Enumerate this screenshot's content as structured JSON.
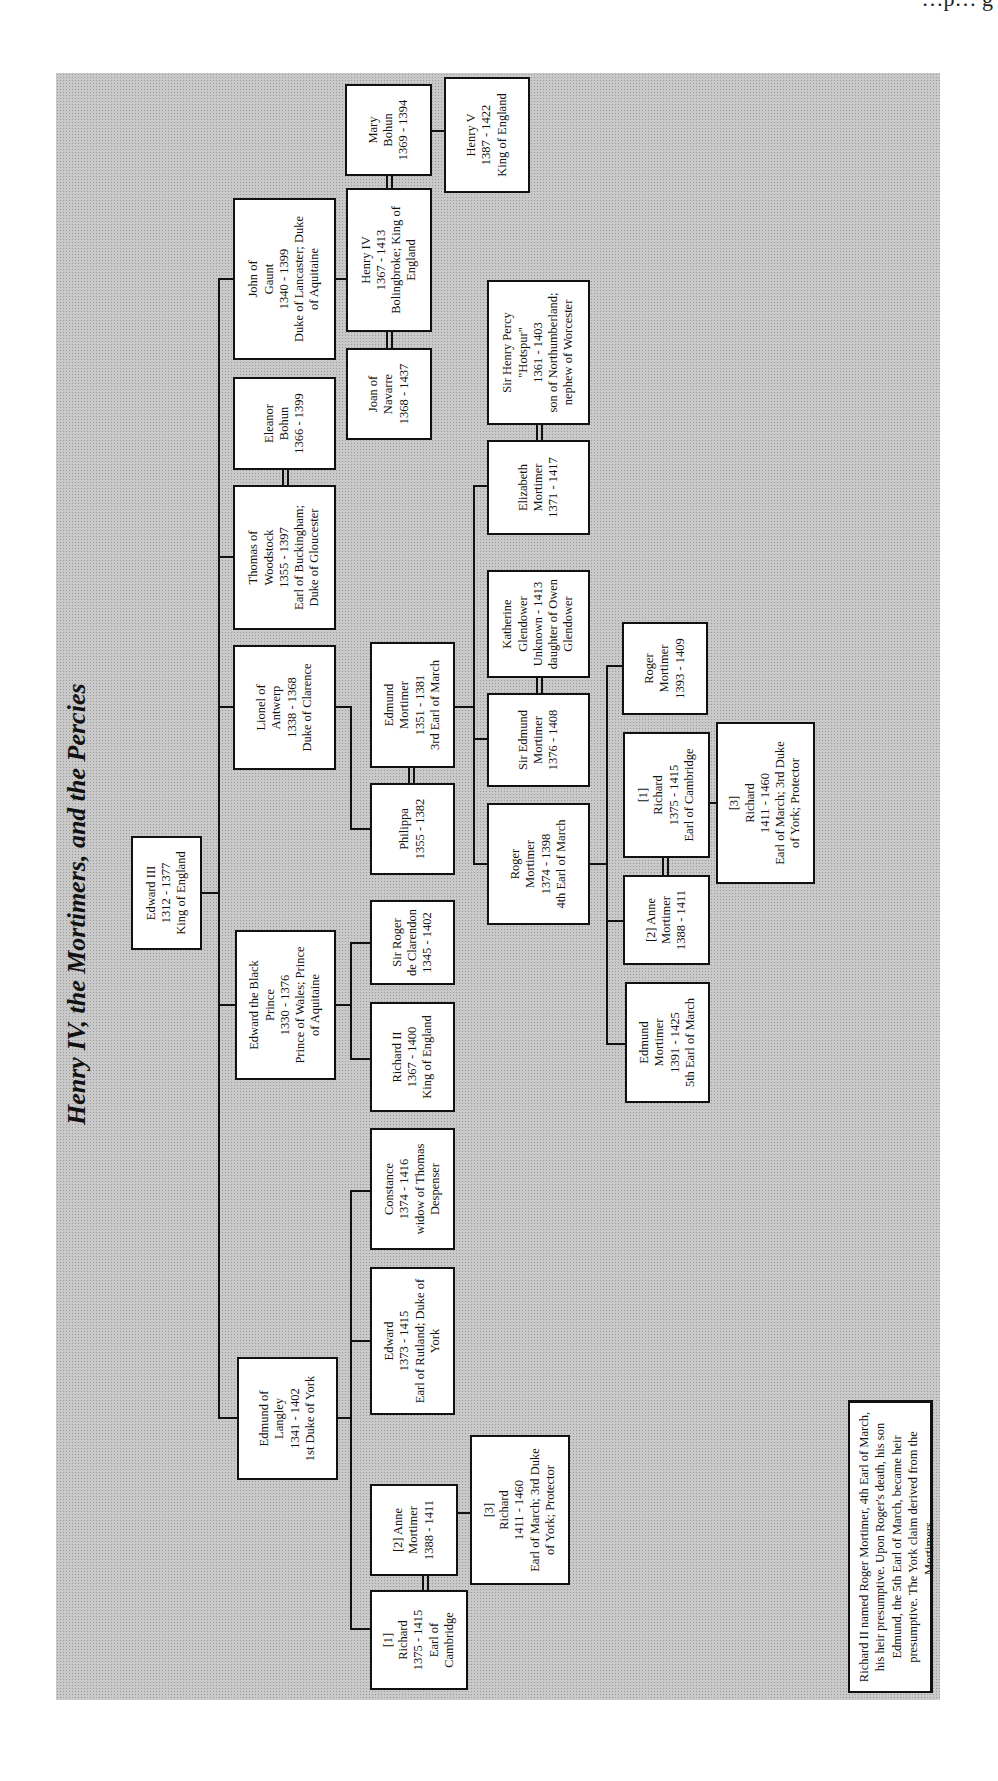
{
  "page_header_fragment": "…p… g",
  "title": "Henry IV, the Mortimers, and the Percies",
  "people": {
    "edward3": [
      "Edward III",
      "1312 - 1377",
      "King of England"
    ],
    "edmund_langley": [
      "Edmund of",
      "Langley",
      "1341 - 1402",
      "1st Duke of York"
    ],
    "black_prince": [
      "Edward the Black",
      "Prince",
      "1330 - 1376",
      "Prince of Wales; Prince",
      "of Aquitaine"
    ],
    "lionel": [
      "Lionel of",
      "Antwerp",
      "1338 - 1368",
      "Duke of Clarence"
    ],
    "thomas": [
      "Thomas of",
      "Woodstock",
      "1355 - 1397",
      "Earl of Buckingham;",
      "Duke of Gloucester"
    ],
    "eleanor_bohun": [
      "Eleanor",
      "Bohun",
      "1366 - 1399"
    ],
    "john_gaunt": [
      "John of",
      "Gaunt",
      "1340 - 1399",
      "Duke of Lancaster; Duke",
      "of Aquitaine"
    ],
    "joan_navarre": [
      "Joan of",
      "Navarre",
      "1368 - 1437"
    ],
    "henry4": [
      "Henry IV",
      "1367 - 1413",
      "Bolingbroke; King of",
      "England"
    ],
    "mary_bohun": [
      "Mary",
      "Bohun",
      "1369 - 1394"
    ],
    "henry5": [
      "Henry V",
      "1387 - 1422",
      "King of England"
    ],
    "edward_york": [
      "Edward",
      "1373 - 1415",
      "Earl of Rutland; Duke of",
      "York"
    ],
    "constance": [
      "Constance",
      "1374 - 1416",
      "widow of Thomas",
      "Despenser"
    ],
    "richard2": [
      "Richard II",
      "1367 - 1400",
      "King of England"
    ],
    "sir_roger": [
      "Sir Roger",
      "de Clarendon",
      "1345 - 1402"
    ],
    "philippa": [
      "Philippa",
      "1355 - 1382"
    ],
    "edmund_mortimer3": [
      "Edmund",
      "Mortimer",
      "1351 - 1381",
      "3rd Earl of March"
    ],
    "roger_mortimer4": [
      "Roger",
      "Mortimer",
      "1374 - 1398",
      "4th Earl of March"
    ],
    "sir_edmund_mortimer": [
      "Sir Edmund",
      "Mortimer",
      "1376 - 1408"
    ],
    "katherine": [
      "Katherine",
      "Glendower",
      "Unknown - 1413",
      "daughter of Owen",
      "Glendower"
    ],
    "elizabeth_mortimer": [
      "Elizabeth",
      "Mortimer",
      "1371 - 1417"
    ],
    "henry_percy": [
      "Sir Henry Percy",
      "\"Hotspur\"",
      "1361 - 1403",
      "son of Northumberland;",
      "nephew of Worcester"
    ],
    "edmund_mortimer5": [
      "Edmund",
      "Mortimer",
      "1391 - 1425",
      "5th Earl of March"
    ],
    "anne_mortimer_a": [
      "[2] Anne",
      "Mortimer",
      "1388 - 1411"
    ],
    "richard_cambridge_a": [
      "[1]",
      "Richard",
      "1375 - 1415",
      "Earl of Cambridge"
    ],
    "richard_york_a": [
      "[3]",
      "Richard",
      "1411 - 1460",
      "Earl of March; 3rd Duke",
      "of York; Protector"
    ],
    "roger_mortimer_1393": [
      "Roger",
      "Mortimer",
      "1393 - 1409"
    ],
    "richard_cambridge_b": [
      "[1]",
      "Richard",
      "1375 - 1415",
      "Earl of Cambridge"
    ],
    "anne_mortimer_b": [
      "[2] Anne",
      "Mortimer",
      "1388 - 1411"
    ],
    "richard_york_b": [
      "[3]",
      "Richard",
      "1411 - 1460",
      "Earl of March; 3rd Duke",
      "of York; Protector"
    ]
  },
  "note": "Richard II named Roger Mortimer, 4th Earl of March, his heir presumptive. Upon Roger's death, his son Edmund, the 5th Earl of March, became heir presumptive. The York claim derived from the Mortimers.",
  "colors": {
    "panel": "#c9c9c9",
    "box": "#ffffff",
    "line": "#111111"
  }
}
